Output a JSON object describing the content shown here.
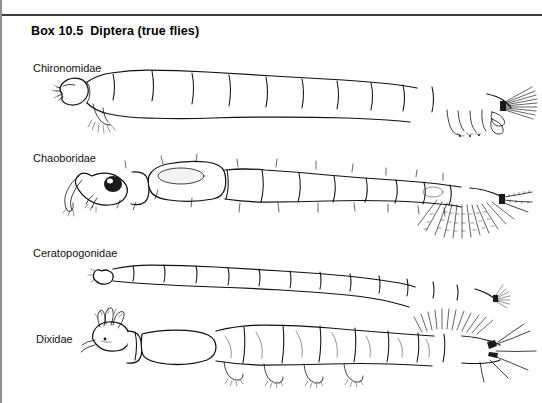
{
  "page": {
    "width": 542,
    "height": 403,
    "background_color": "#ffffff",
    "rule_color": "#3a3c40",
    "border_color": "#8e9094",
    "ink_color": "#111111"
  },
  "heading": {
    "box_number": "Box 10.5",
    "title": "Diptera (true flies)"
  },
  "figure": {
    "type": "scientific-line-illustration",
    "view": "lateral",
    "specimens": [
      {
        "id": "chironomidae",
        "label": "Chironomidae",
        "label_x": 33,
        "label_y": 62,
        "orientation": "head-left",
        "body_segments": 11,
        "features": [
          "anterior prolegs",
          "posterior prolegs",
          "anal tubules",
          "anal setal fan",
          "distinct head capsule"
        ]
      },
      {
        "id": "chaoboridae",
        "label": "Chaoboridae",
        "label_x": 33,
        "label_y": 152,
        "orientation": "head-left",
        "body_segments": 10,
        "features": [
          "dark compound eye",
          "prehensile antennae",
          "paired hydrostatic air sacs",
          "scattered body setae",
          "plumose caudal fan"
        ]
      },
      {
        "id": "ceratopogonidae",
        "label": "Ceratopogonidae",
        "label_x": 33,
        "label_y": 247,
        "orientation": "head-left",
        "body_segments": 12,
        "features": [
          "slender vermiform body",
          "no prolegs",
          "small sclerotised head",
          "caudal setal tuft"
        ]
      },
      {
        "id": "dixidae",
        "label": "Dixidae",
        "label_x": 36,
        "label_y": 333,
        "orientation": "head-left",
        "body_segments": 10,
        "features": [
          "mouth brushes",
          "ventral prolegs",
          "dorsal setal brush",
          "long caudal filaments"
        ]
      }
    ]
  }
}
